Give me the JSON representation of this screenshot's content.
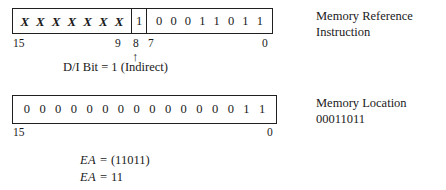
{
  "figure": {
    "instruction_word": {
      "name": "Memory Reference Instruction",
      "opcode_field": {
        "bits": [
          "X",
          "X",
          "X",
          "X",
          "X",
          "X",
          "X"
        ],
        "high_label": "15",
        "low_label": "9"
      },
      "di_field": {
        "bits": [
          "1"
        ],
        "label": "8",
        "caption": "D/I Bit = 1 (Indirect)",
        "arrow": "↑"
      },
      "address_field": {
        "bits": [
          "0",
          "0",
          "0",
          "1",
          "1",
          "0",
          "1",
          "1"
        ],
        "high_label": "7",
        "low_label": "0"
      },
      "note_line1": "Memory Reference",
      "note_line2": "Instruction"
    },
    "memory_word": {
      "bits": [
        "0",
        "0",
        "0",
        "0",
        "0",
        "0",
        "0",
        "0",
        "0",
        "0",
        "0",
        "0",
        "0",
        "0",
        "1",
        "1"
      ],
      "high_label": "15",
      "low_label": "0",
      "note_line1": "Memory Location",
      "note_line2": "00011011"
    },
    "result": {
      "line1_symbol": "EA",
      "line1_equals": "=",
      "line1_value": "(11011)",
      "line2_symbol": "EA",
      "line2_equals": "=",
      "line2_value": "11"
    },
    "colors": {
      "ink": "#1a1a1a",
      "box_border": "#202020",
      "page_background": "#ffffff"
    }
  }
}
